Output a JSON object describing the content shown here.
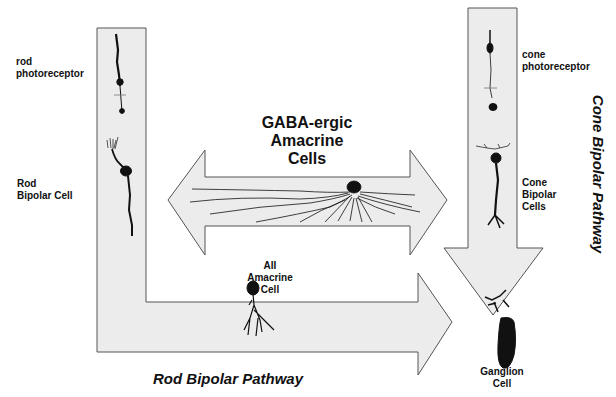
{
  "diagram": {
    "colors": {
      "arrow_fill": "#ececec",
      "arrow_stroke": "#555555",
      "cell_ink": "#111111",
      "background": "#ffffff"
    },
    "labels": {
      "rod_photoreceptor": "rod\nphotoreceptor",
      "rod_bipolar_cell": "Rod\nBipolar Cell",
      "gaba_amacrine": "GABA-ergic\nAmacrine\nCells",
      "aii_amacrine": "AII\nAmacrine\nCell",
      "cone_photoreceptor": "cone\nphotoreceptor",
      "cone_bipolar_cells": "Cone\nBipolar\nCells",
      "ganglion_cell": "Ganglion\nCell"
    },
    "pathways": {
      "rod": "Rod Bipolar Pathway",
      "cone": "Cone Bipolar Pathway"
    },
    "arrows": [
      {
        "name": "rod-pathway-arrow",
        "shape": "L-shaped, down then right"
      },
      {
        "name": "amacrine-double-arrow",
        "shape": "horizontal bidirectional"
      },
      {
        "name": "cone-pathway-arrow",
        "shape": "vertical, downward"
      }
    ]
  }
}
